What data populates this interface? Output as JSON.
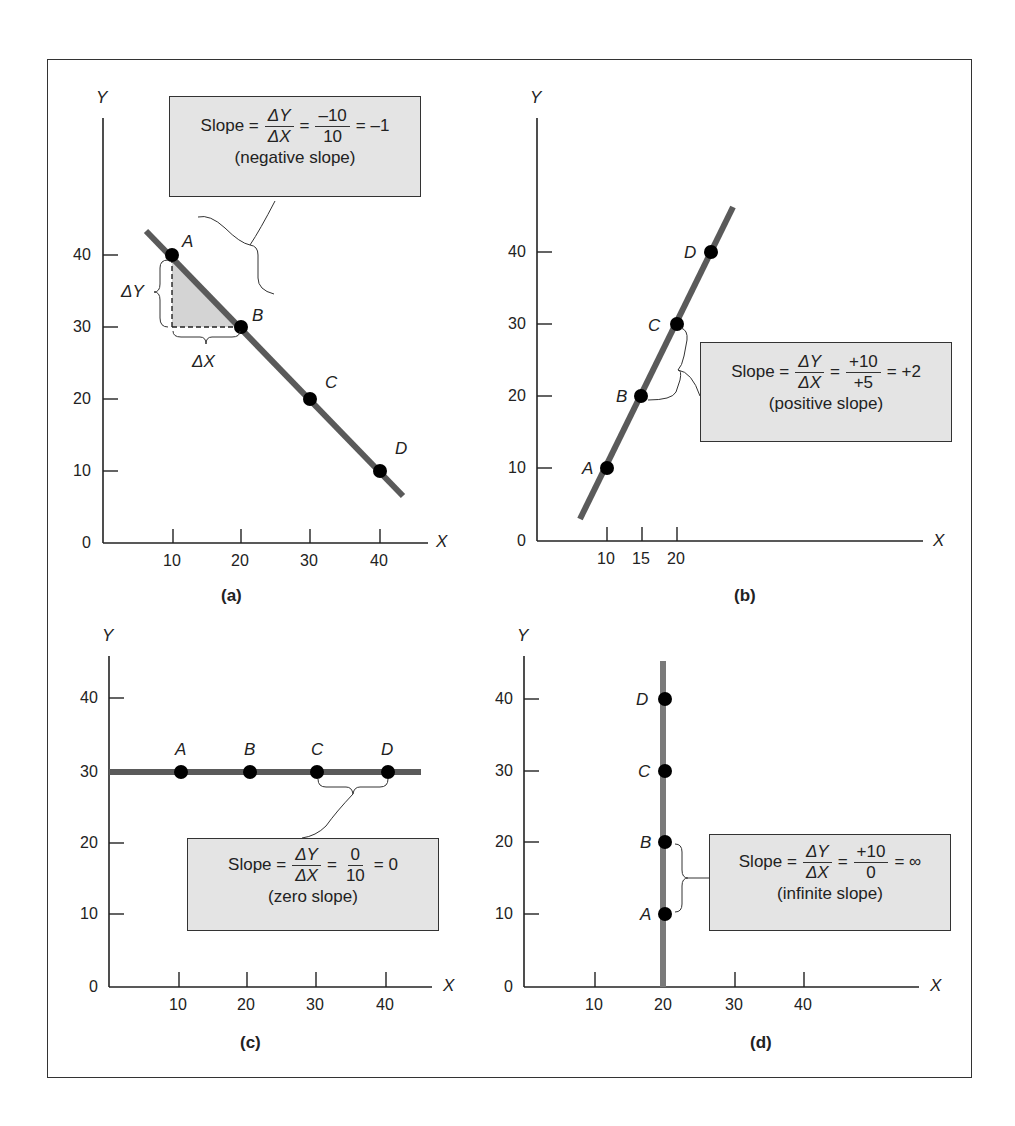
{
  "figure": {
    "panels": [
      {
        "id": "a",
        "caption": "(a)",
        "x_axis_label": "X",
        "y_axis_label": "Y",
        "x_ticks": [
          "10",
          "20",
          "30",
          "40"
        ],
        "y_ticks": [
          "0",
          "10",
          "20",
          "30",
          "40"
        ],
        "points": [
          {
            "label": "A",
            "x": 10,
            "y": 40
          },
          {
            "label": "B",
            "x": 20,
            "y": 30
          },
          {
            "label": "C",
            "x": 30,
            "y": 20
          },
          {
            "label": "D",
            "x": 40,
            "y": 10
          }
        ],
        "delta_y_label": "ΔY",
        "delta_x_label": "ΔX",
        "callout": {
          "prefix": "Slope =",
          "frac1_num": "ΔY",
          "frac1_den": "ΔX",
          "eq": "=",
          "frac2_num": "–10",
          "frac2_den": "10",
          "result": "= –1",
          "note": "(negative slope)"
        }
      },
      {
        "id": "b",
        "caption": "(b)",
        "x_axis_label": "X",
        "y_axis_label": "Y",
        "x_ticks": [
          "10",
          "15",
          "20"
        ],
        "y_ticks": [
          "0",
          "10",
          "20",
          "30",
          "40"
        ],
        "points": [
          {
            "label": "A",
            "x": 10,
            "y": 10
          },
          {
            "label": "B",
            "x": 15,
            "y": 20
          },
          {
            "label": "C",
            "x": 20,
            "y": 30
          },
          {
            "label": "D",
            "x": 25,
            "y": 40
          }
        ],
        "callout": {
          "prefix": "Slope =",
          "frac1_num": "ΔY",
          "frac1_den": "ΔX",
          "eq": "=",
          "frac2_num": "+10",
          "frac2_den": "+5",
          "result": "= +2",
          "note": "(positive slope)"
        }
      },
      {
        "id": "c",
        "caption": "(c)",
        "x_axis_label": "X",
        "y_axis_label": "Y",
        "x_ticks": [
          "10",
          "20",
          "30",
          "40"
        ],
        "y_ticks": [
          "0",
          "10",
          "20",
          "30",
          "40"
        ],
        "points": [
          {
            "label": "A",
            "x": 10,
            "y": 30
          },
          {
            "label": "B",
            "x": 20,
            "y": 30
          },
          {
            "label": "C",
            "x": 30,
            "y": 30
          },
          {
            "label": "D",
            "x": 40,
            "y": 30
          }
        ],
        "callout": {
          "prefix": "Slope =",
          "frac1_num": "ΔY",
          "frac1_den": "ΔX",
          "eq": "=",
          "frac2_num": "0",
          "frac2_den": "10",
          "result": "= 0",
          "note": "(zero slope)"
        }
      },
      {
        "id": "d",
        "caption": "(d)",
        "x_axis_label": "X",
        "y_axis_label": "Y",
        "x_ticks": [
          "10",
          "20",
          "30",
          "40"
        ],
        "y_ticks": [
          "0",
          "10",
          "20",
          "30",
          "40"
        ],
        "points": [
          {
            "label": "A",
            "x": 20,
            "y": 10
          },
          {
            "label": "B",
            "x": 20,
            "y": 20
          },
          {
            "label": "C",
            "x": 20,
            "y": 30
          },
          {
            "label": "D",
            "x": 20,
            "y": 40
          }
        ],
        "callout": {
          "prefix": "Slope =",
          "frac1_num": "ΔY",
          "frac1_den": "ΔX",
          "eq": "=",
          "frac2_num": "+10",
          "frac2_den": "0",
          "result": "= ∞",
          "note": "(infinite slope)"
        }
      }
    ]
  },
  "colors": {
    "line": "#5a5a5a",
    "point": "#000000",
    "callout_bg": "#e4e4e4",
    "triangle_fill": "#d4d4d4",
    "axis": "#222222"
  }
}
